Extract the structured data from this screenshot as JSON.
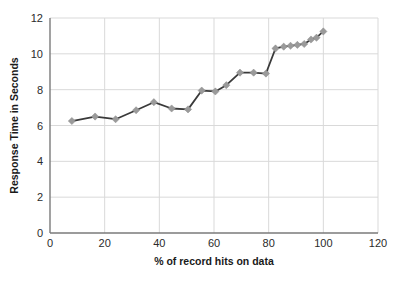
{
  "chart_data": {
    "type": "line",
    "title": "",
    "xlabel": "% of record hits on data",
    "ylabel": "Response Time in Seconds",
    "xlim": [
      0,
      120
    ],
    "ylim": [
      0,
      12
    ],
    "xticks": [
      0,
      20,
      40,
      60,
      80,
      100,
      120
    ],
    "yticks": [
      0,
      2,
      4,
      6,
      8,
      10,
      12
    ],
    "xtick_labels": [
      "0",
      "20",
      "40",
      "60",
      "80",
      "100",
      "120"
    ],
    "ytick_labels": [
      "0",
      "2",
      "4",
      "6",
      "8",
      "10",
      "12"
    ],
    "grid": "horizontal-and-vertical",
    "legend": "none",
    "marker": "diamond",
    "series": [
      {
        "name": "Response Time",
        "line_color": "#3a3a3a",
        "marker_color": "#9a9a9a",
        "x": [
          8,
          16.5,
          24,
          31.5,
          38,
          44.5,
          50.5,
          55.5,
          60.5,
          64.5,
          69.5,
          74.5,
          79,
          82.5,
          85.5,
          88,
          90.5,
          93,
          95.5,
          97.5,
          100
        ],
        "y": [
          6.25,
          6.5,
          6.35,
          6.85,
          7.3,
          6.95,
          6.9,
          7.95,
          7.9,
          8.25,
          8.95,
          8.95,
          8.9,
          10.3,
          10.4,
          10.45,
          10.5,
          10.55,
          10.8,
          10.9,
          11.25
        ]
      }
    ]
  }
}
